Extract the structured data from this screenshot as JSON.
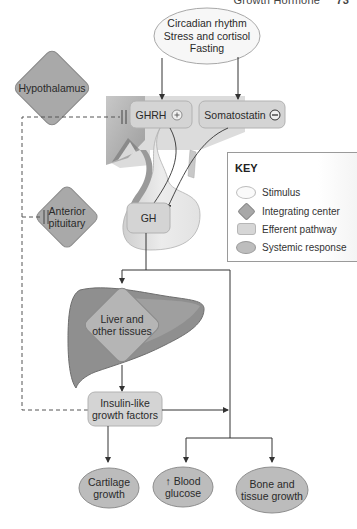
{
  "header": {
    "text": "Growth Hormone",
    "page": "73"
  },
  "stimulus": {
    "lines": [
      "Circadian rhythm",
      "Stress and cortisol",
      "Fasting"
    ]
  },
  "integrating_centers": {
    "hypothalamus": "Hypothalamus",
    "anterior_pituitary": [
      "Anterior",
      "pituitary"
    ],
    "liver": [
      "Liver and",
      "other tissues"
    ]
  },
  "efferent": {
    "ghrh": {
      "label": "GHRH",
      "sign": "+"
    },
    "somatostatin": {
      "label": "Somatostatin",
      "sign": "−"
    },
    "gh": {
      "label": "GH"
    },
    "igf": {
      "lines": [
        "Insulin-like",
        "growth factors"
      ]
    }
  },
  "responses": [
    {
      "lines": [
        "Cartilage",
        "growth"
      ]
    },
    {
      "lines": [
        "↑ Blood",
        "glucose"
      ]
    },
    {
      "lines": [
        "Bone and",
        "tissue growth"
      ]
    }
  ],
  "key": {
    "title": "KEY",
    "items": [
      {
        "symbol": "stimulus",
        "label": "Stimulus"
      },
      {
        "symbol": "integrating-center",
        "label": "Integrating center"
      },
      {
        "symbol": "efferent-pathway",
        "label": "Efferent pathway"
      },
      {
        "symbol": "systemic-response",
        "label": "Systemic response"
      }
    ]
  },
  "colors": {
    "stimulus_fill": "#f7f7f7",
    "diamond_fill": "#a9a9a9",
    "efferent_fill": "#d4d4d4",
    "response_fill": "#bcbcbc",
    "liver_fill": "#8e8e8e",
    "line": "#444444"
  }
}
